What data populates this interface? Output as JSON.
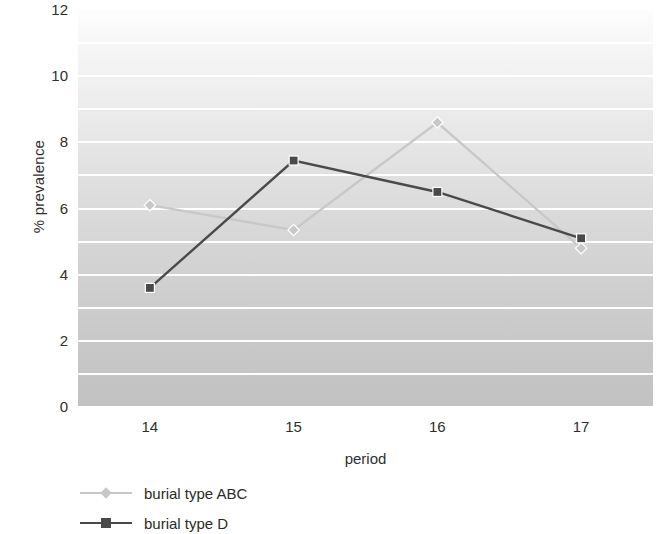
{
  "chart_data": {
    "type": "line",
    "title": "",
    "xlabel": "period",
    "ylabel": "% prevalence",
    "categories": [
      "14",
      "15",
      "16",
      "17"
    ],
    "ylim": [
      0,
      12
    ],
    "y_ticks": [
      "12",
      "10",
      "8",
      "6",
      "4",
      "2",
      "0"
    ],
    "y_tick_values": [
      12,
      10,
      8,
      6,
      4,
      2,
      0
    ],
    "gridlines": {
      "visible": true,
      "step": 1,
      "color": "#ffffff"
    },
    "legend": {
      "position": "bottom-left"
    },
    "series": [
      {
        "name": "burial type ABC",
        "color": "#c8c8c8",
        "marker": "diamond",
        "values": [
          6.1,
          5.35,
          8.6,
          4.8
        ]
      },
      {
        "name": "burial type D",
        "color": "#4a4a4a",
        "marker": "square",
        "values": [
          3.6,
          7.45,
          6.5,
          5.1
        ]
      }
    ]
  },
  "colors": {
    "series_abc": "#c8c8c8",
    "series_d": "#4a4a4a",
    "gridline": "#ffffff",
    "text": "#2f2f2f",
    "plot_bg_top": "#fdfdfd",
    "plot_bg_bottom": "#c2c2c2"
  }
}
